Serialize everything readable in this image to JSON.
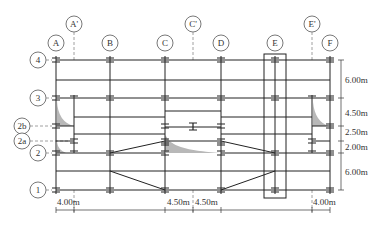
{
  "diagram": {
    "type": "structural-grid-plan",
    "column_axes": [
      {
        "label": "A",
        "x": 56,
        "primary": true
      },
      {
        "label": "A'",
        "x": 74,
        "primary": false
      },
      {
        "label": "B",
        "x": 110,
        "primary": true
      },
      {
        "label": "C",
        "x": 165,
        "primary": true
      },
      {
        "label": "C'",
        "x": 193,
        "primary": false
      },
      {
        "label": "D",
        "x": 221,
        "primary": true
      },
      {
        "label": "E",
        "x": 275,
        "primary": true
      },
      {
        "label": "E'",
        "x": 312,
        "primary": false
      },
      {
        "label": "F",
        "x": 330,
        "primary": true
      }
    ],
    "row_axes": [
      {
        "label": "4",
        "y": 60
      },
      {
        "label": "3",
        "y": 98
      },
      {
        "label": "2b",
        "y": 126
      },
      {
        "label": "2a",
        "y": 141
      },
      {
        "label": "2",
        "y": 153
      },
      {
        "label": "1",
        "y": 190
      }
    ],
    "right_dimensions": [
      {
        "label": "6.00m",
        "from": "4",
        "to": "3"
      },
      {
        "label": "4.50m",
        "from": "3",
        "to": "2b"
      },
      {
        "label": "2.50m",
        "from": "2b",
        "to": "2a"
      },
      {
        "label": "2.00m",
        "from": "2a",
        "to": "2"
      },
      {
        "label": "6.00m",
        "from": "2",
        "to": "1"
      }
    ],
    "bottom_dimensions": [
      {
        "label": "4.00m",
        "from": "A",
        "to": "A'"
      },
      {
        "label": "4.50m",
        "from": "C",
        "to": "C'"
      },
      {
        "label": "4.50m",
        "from": "C'",
        "to": "D"
      },
      {
        "label": "4.00m",
        "from": "E'",
        "to": "F"
      }
    ],
    "highlight_box": {
      "axis": "E",
      "description": "boxed column line E"
    },
    "colors": {
      "line": "#222222",
      "dash": "#888888",
      "shade": "#b8b8b8",
      "bubble": "#555555"
    }
  }
}
